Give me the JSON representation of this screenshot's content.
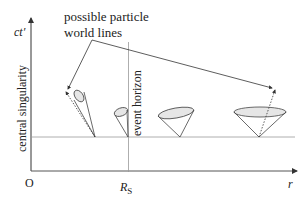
{
  "diagram": {
    "title_annotation": "possible particle world lines",
    "annotation_line1": "possible particle",
    "annotation_line2": "world lines",
    "y_axis_label": "ct′",
    "x_axis_label": "r",
    "origin_label": "O",
    "rs_label_main": "R",
    "rs_label_sub": "S",
    "singularity_label": "central singularity",
    "horizon_label": "event horizon",
    "colors": {
      "axis": "#333333",
      "grid": "#999999",
      "cone_stroke": "#444444",
      "cone_fill": "#e6e6e6",
      "text": "#222222"
    },
    "light_cones": [
      {
        "name": "cone-inside-horizon",
        "apex_x": 95,
        "tilt": "left-strong"
      },
      {
        "name": "cone-at-horizon",
        "apex_x": 128,
        "tilt": "left-vertical-edge"
      },
      {
        "name": "cone-near-horizon",
        "apex_x": 180,
        "tilt": "left-slight"
      },
      {
        "name": "cone-far",
        "apex_x": 259,
        "tilt": "upright"
      }
    ]
  }
}
